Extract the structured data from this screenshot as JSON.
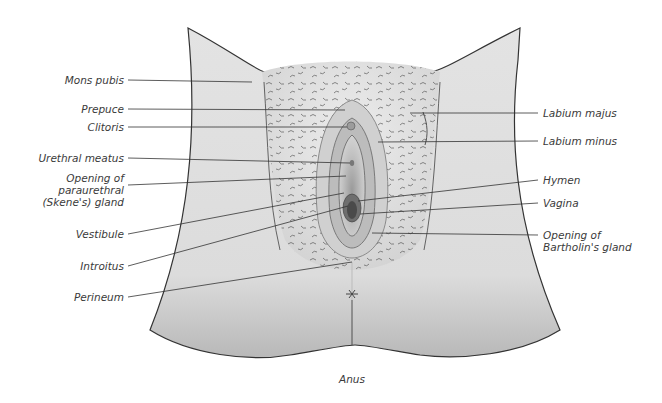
{
  "diagram": {
    "labels_left": [
      {
        "id": "mons-pubis",
        "text": "Mons pubis",
        "x": 124,
        "y": 75
      },
      {
        "id": "prepuce",
        "text": "Prepuce",
        "x": 124,
        "y": 104
      },
      {
        "id": "clitoris",
        "text": "Clitoris",
        "x": 124,
        "y": 122
      },
      {
        "id": "urethral-meatus",
        "text": "Urethral meatus",
        "x": 124,
        "y": 153
      },
      {
        "id": "opening-paraurethral",
        "text": "Opening of\nparaurethral\n(Skene's) gland",
        "x": 124,
        "y": 172
      },
      {
        "id": "vestibule",
        "text": "Vestibule",
        "x": 124,
        "y": 228
      },
      {
        "id": "introitus",
        "text": "Introitus",
        "x": 124,
        "y": 260
      },
      {
        "id": "perineum",
        "text": "Perineum",
        "x": 124,
        "y": 292
      }
    ],
    "labels_right": [
      {
        "id": "labium-majus",
        "text": "Labium majus",
        "x": 542,
        "y": 108
      },
      {
        "id": "labium-minus",
        "text": "Labium minus",
        "x": 542,
        "y": 136
      },
      {
        "id": "hymen",
        "text": "Hymen",
        "x": 542,
        "y": 175
      },
      {
        "id": "vagina",
        "text": "Vagina",
        "x": 542,
        "y": 198
      },
      {
        "id": "opening-bartholin",
        "text": "Opening of\nBartholin's gland",
        "x": 542,
        "y": 229
      }
    ],
    "labels_bottom": [
      {
        "id": "anus",
        "text": "Anus",
        "x": 352,
        "y": 373
      }
    ],
    "colors": {
      "skin_light": "#e6e6e6",
      "skin_mid": "#cfcfcf",
      "skin_dark": "#a8a8a8",
      "hair": "#555555",
      "leader_line": "#333333",
      "label_text": "#3a3a3a"
    }
  }
}
